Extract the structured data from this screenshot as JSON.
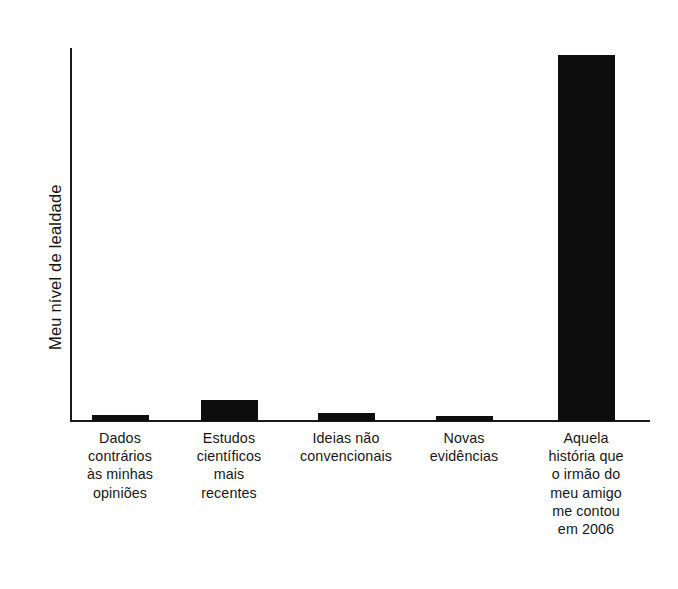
{
  "chart_data": {
    "type": "bar",
    "title": "",
    "subtitle": "",
    "xlabel": "",
    "ylabel": "Meu nível de lealdade",
    "categories": [
      "Dados contrários às minhas opiniões",
      "Estudos científicos mais recentes",
      "Ideias não convencionais",
      "Novas evidências",
      "Aquela história que o irmão do meu amigo me contou em 2006"
    ],
    "category_lines": [
      [
        "Dados",
        "contrários",
        "às minhas",
        "opiniões"
      ],
      [
        "Estudos",
        "científicos",
        "mais",
        "recentes"
      ],
      [
        "Ideias não",
        "convencionais"
      ],
      [
        "Novas",
        "evidências"
      ],
      [
        "Aquela",
        "história que",
        "o irmão do",
        "meu amigo",
        "me contou",
        "em 2006"
      ]
    ],
    "values": [
      1.6,
      5.6,
      2.1,
      1.3,
      98.0
    ],
    "ylim": [
      0,
      100
    ],
    "grid": false,
    "legend": false,
    "legend_position": "none",
    "bar_color": "#0d0d0d",
    "axis_color": "#1a1a1a",
    "background_color": "#ffffff",
    "y_tick_labels": [],
    "x_tick_labels": [
      "Dados contrários às minhas opiniões",
      "Estudos científicos mais recentes",
      "Ideias não convencionais",
      "Novas evidências",
      "Aquela história que o irmão do meu amigo me contou em 2006"
    ],
    "annotations": []
  },
  "figure": {
    "y_axis_title": "Meu nível de lealdade"
  }
}
